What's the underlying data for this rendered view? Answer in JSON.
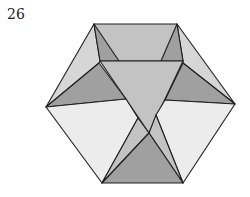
{
  "step": {
    "number": "26"
  },
  "diagram": {
    "colors": {
      "lightest": "#ececec",
      "light": "#d6d6d6",
      "mid": "#c3c3c3",
      "dark": "#a0a0a0",
      "stroke": "#1e1e1e"
    },
    "faces": [
      {
        "name": "top-band",
        "fill": "mid",
        "points": "94,24 177,24 183,61 100,61"
      },
      {
        "name": "upper-left-side",
        "fill": "light",
        "points": "94,24 100,61 99,63 46,107"
      },
      {
        "name": "upper-right-side",
        "fill": "light",
        "points": "177,24 183,61 183,63 235,104"
      },
      {
        "name": "top-left-inner-flap",
        "fill": "dark",
        "points": "94,24 100,61 119,61"
      },
      {
        "name": "top-right-inner-flap",
        "fill": "dark",
        "points": "177,24 183,61 161,61"
      },
      {
        "name": "center-inverted-triangle",
        "fill": "mid",
        "points": "100,61 183,61 149,133"
      },
      {
        "name": "left-dark-flap",
        "fill": "dark",
        "points": "99,63 126,99 46,107"
      },
      {
        "name": "right-dark-flap",
        "fill": "dark",
        "points": "183,63 235,104 165,100"
      },
      {
        "name": "lower-left-face",
        "fill": "lightest",
        "points": "46,107 126,99 138,118 102,183"
      },
      {
        "name": "lower-right-face",
        "fill": "lightest",
        "points": "235,104 165,100 156,115 183,183"
      },
      {
        "name": "lower-left-inner-flap",
        "fill": "mid",
        "points": "138,118 149,133 102,183"
      },
      {
        "name": "lower-right-inner-flap",
        "fill": "mid",
        "points": "156,115 149,133 183,183"
      },
      {
        "name": "bottom-dark-triangle",
        "fill": "dark",
        "points": "149,133 183,183 102,183"
      }
    ]
  }
}
